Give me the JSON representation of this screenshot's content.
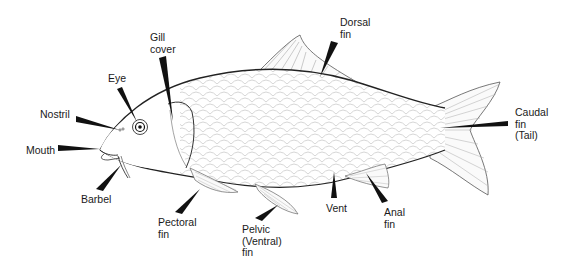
{
  "diagram": {
    "labels": {
      "dorsal_fin": "Dorsal\nfin",
      "gill_cover": "Gill\ncover",
      "eye": "Eye",
      "nostril": "Nostril",
      "mouth": "Mouth",
      "barbel": "Barbel",
      "pectoral_fin": "Pectoral\nfin",
      "pelvic_fin": "Pelvic\n(Ventral)\nfin",
      "vent": "Vent",
      "anal_fin": "Anal\nfin",
      "caudal_fin": "Caudal\nfin\n(Tail)"
    },
    "colors": {
      "ink": "#1a1a1a",
      "background": "#ffffff",
      "fin_stroke": "#888888",
      "scale_stroke": "#bbbbbb"
    }
  }
}
